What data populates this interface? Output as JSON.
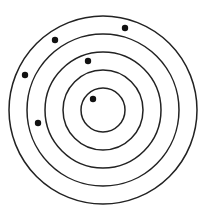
{
  "diagram": {
    "type": "concentric-rings-with-dots",
    "background": "#ffffff",
    "stroke_color": "#222222",
    "dot_color": "#111111",
    "center": {
      "x": 103,
      "y": 110
    },
    "rings": [
      {
        "r": 94
      },
      {
        "r": 76
      },
      {
        "r": 58
      },
      {
        "r": 40
      },
      {
        "r": 22
      }
    ],
    "dots": [
      {
        "x": 125,
        "y": 28,
        "r": 3.2
      },
      {
        "x": 55,
        "y": 40,
        "r": 3.2
      },
      {
        "x": 88,
        "y": 61,
        "r": 3.2
      },
      {
        "x": 25,
        "y": 75,
        "r": 3.2
      },
      {
        "x": 38,
        "y": 123,
        "r": 3.2
      },
      {
        "x": 93,
        "y": 99,
        "r": 3.2
      }
    ]
  }
}
